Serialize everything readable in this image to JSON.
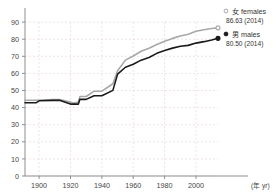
{
  "chart_data": {
    "type": "line",
    "title": "",
    "xlabel": "(年 yr)",
    "ylabel": "",
    "xlim": [
      1891,
      2014
    ],
    "ylim": [
      0,
      90
    ],
    "grid": true,
    "legend_position": "right",
    "x_ticks": [
      "1900",
      "1920",
      "1940",
      "1960",
      "1980",
      "2000"
    ],
    "x_tick_values": [
      1900,
      1920,
      1940,
      1960,
      1980,
      2000
    ],
    "y_ticks": [
      "0",
      "10",
      "20",
      "30",
      "40",
      "50",
      "60",
      "70",
      "80",
      "90"
    ],
    "y_tick_values": [
      0,
      10,
      20,
      30,
      40,
      50,
      60,
      70,
      80,
      90
    ],
    "series": [
      {
        "name": "女 females",
        "label_value": "86.63 (2014)",
        "color": "#a8a8a8",
        "end_value": 86.63,
        "end_year": 2014,
        "x": [
          1891,
          1898,
          1900,
          1909,
          1913,
          1920,
          1922,
          1925,
          1926,
          1930,
          1935,
          1940,
          1947,
          1950,
          1955,
          1960,
          1965,
          1970,
          1975,
          1980,
          1985,
          1990,
          1995,
          2000,
          2005,
          2010,
          2014
        ],
        "values": [
          44.3,
          44.3,
          44.3,
          44.7,
          44.7,
          43.2,
          42.6,
          43.2,
          46.5,
          46.5,
          49.6,
          49.6,
          53.96,
          61.5,
          67.75,
          70.19,
          72.92,
          74.66,
          76.89,
          78.76,
          80.48,
          81.9,
          82.85,
          84.6,
          85.52,
          86.3,
          86.63
        ]
      },
      {
        "name": "男 males",
        "label_value": "80.50 (2014)",
        "color": "#1a1a1a",
        "end_value": 80.5,
        "end_year": 2014,
        "x": [
          1891,
          1898,
          1900,
          1909,
          1913,
          1920,
          1922,
          1925,
          1926,
          1930,
          1935,
          1940,
          1947,
          1950,
          1955,
          1960,
          1965,
          1970,
          1975,
          1980,
          1985,
          1990,
          1995,
          2000,
          2005,
          2010,
          2014
        ],
        "values": [
          42.8,
          42.8,
          43.97,
          44.25,
          44.25,
          42.06,
          42.06,
          42.06,
          44.82,
          44.82,
          46.92,
          46.92,
          50.06,
          59.57,
          63.6,
          65.32,
          67.74,
          69.31,
          71.73,
          73.35,
          74.78,
          75.92,
          76.38,
          77.72,
          78.56,
          79.55,
          80.5
        ]
      }
    ]
  },
  "legend": {
    "females": {
      "name": "女 females",
      "value": "86.63 (2014)",
      "marker": "open-circle-marker"
    },
    "males": {
      "name": "男 males",
      "value": "80.50 (2014)",
      "marker": "filled-circle-marker"
    }
  },
  "axes": {
    "x_unit_label": "(年 yr)"
  },
  "colors": {
    "females_line": "#a8a8a8",
    "males_line": "#1a1a1a",
    "gridline": "#e8d8d8",
    "axis": "#888888",
    "text": "#333333"
  }
}
